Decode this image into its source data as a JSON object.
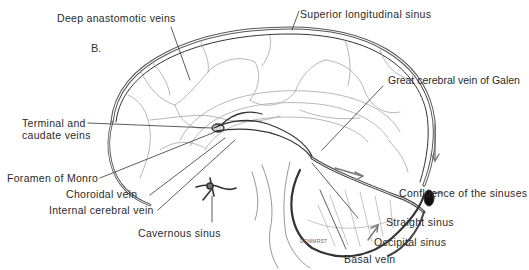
{
  "figure": {
    "panel_label": "B.",
    "signature": "DOMMRST",
    "colors": {
      "ink": "#2a2a2a",
      "line": "#444444",
      "faint": "#9a9a9a",
      "bg": "#ffffff"
    }
  },
  "labels": {
    "deep_anastomotic": "Deep anastomotic veins",
    "superior_longitudinal": "Superior longitudinal sinus",
    "great_cerebral": "Great cerebral vein of Galen",
    "terminal_caudate_1": "Terminal and",
    "terminal_caudate_2": "caudate veins",
    "foramen_monro": "Foramen of Monro",
    "choroidal": "Choroidal vein",
    "internal_cerebral": "Internal cerebral vein",
    "cavernous": "Cavernous sinus",
    "confluence": "Confluence of the sinuses",
    "straight": "Straight sinus",
    "occipital": "Occipital sinus",
    "basal": "Basal vein"
  }
}
